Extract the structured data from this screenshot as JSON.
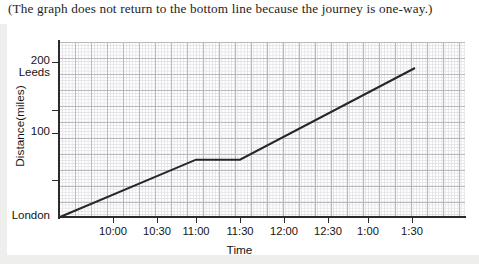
{
  "caption": "(The graph does not return to the bottom line because the journey is one-way.)",
  "chart_data": {
    "type": "line",
    "title": "",
    "xlabel": "Time",
    "ylabel": "Distance(miles)",
    "grid": true,
    "grid_style": "graph-paper",
    "legend": "none",
    "xlim": [
      "09:45",
      "02:00"
    ],
    "ylim": [
      0,
      230
    ],
    "x_tick_labels": [
      "10:00",
      "10:30",
      "11:00",
      "11:30",
      "12:00",
      "12:30",
      "1:00",
      "1:30"
    ],
    "y_tick_labels": [
      "London",
      "100",
      "200"
    ],
    "y_endpoint_labels": {
      "bottom": "London",
      "top_value": "200",
      "top_place": "Leeds"
    },
    "series": [
      {
        "name": "journey",
        "color": "#262626",
        "points": [
          {
            "x": "09:45",
            "y": 0,
            "label": "London"
          },
          {
            "x": "11:00",
            "y": 75
          },
          {
            "x": "11:30",
            "y": 75
          },
          {
            "x": "01:45",
            "y": 195,
            "label": "near Leeds"
          }
        ],
        "description": "One-way journey: steady travel from London, a stop between 11:00 and 11:30, then steady travel on toward Leeds."
      }
    ]
  }
}
